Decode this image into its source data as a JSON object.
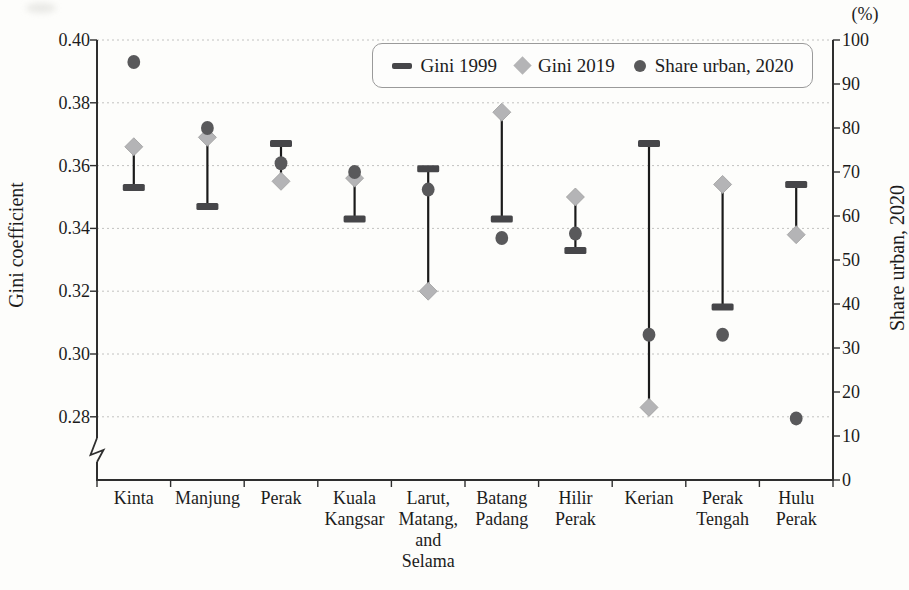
{
  "figure": {
    "unit_label": "(%)",
    "left_axis_title": "Gini coefficient",
    "right_axis_title": "Share urban, 2020",
    "legend_items": [
      {
        "marker": "dash-icon",
        "label": "Gini 1999"
      },
      {
        "marker": "diamond-icon",
        "label": "Gini 2019"
      },
      {
        "marker": "circle-icon",
        "label": "Share urban, 2020"
      }
    ],
    "colors": {
      "gini1999_dash": "#464649",
      "gini2019_diamond": "#b4b4b6",
      "gini2019_diamond_edge": "#9e9e9e",
      "share_urban_circle": "#59595b",
      "connector_line": "#1a1a1a",
      "gridline": "#c2c2c0",
      "axis": "#2e2e2e",
      "text": "#1c1c1c",
      "legend_border": "#9a9a9a"
    }
  },
  "chart_data": {
    "type": "scatter",
    "title": "",
    "categories": [
      "Kinta",
      "Manjung",
      "Perak",
      "Kuala Kangsar",
      "Larut, Matang, and Selama",
      "Batang Padang",
      "Hilir Perak",
      "Kerian",
      "Perak Tengah",
      "Hulu Perak"
    ],
    "category_display": [
      "Kinta",
      "Manjung",
      "Perak",
      "Kuala\nKangsar",
      "Larut,\nMatang,\nand\nSelama",
      "Batang\nPadang",
      "Hilir\nPerak",
      "Kerian",
      "Perak\nTengah",
      "Hulu\nPerak"
    ],
    "series": [
      {
        "name": "Gini 1999",
        "marker": "dash",
        "axis": "left",
        "values": [
          0.353,
          0.347,
          0.367,
          0.343,
          0.359,
          0.343,
          0.333,
          0.367,
          0.315,
          0.354
        ]
      },
      {
        "name": "Gini 2019",
        "marker": "diamond",
        "axis": "left",
        "values": [
          0.366,
          0.369,
          0.355,
          0.356,
          0.32,
          0.377,
          0.35,
          0.283,
          0.354,
          0.338
        ]
      },
      {
        "name": "Share urban, 2020",
        "marker": "circle",
        "axis": "right",
        "values": [
          95,
          80,
          72,
          70,
          66,
          55,
          56,
          33,
          33,
          14
        ]
      }
    ],
    "left_axis": {
      "label": "Gini coefficient",
      "ticks": [
        0.4,
        0.38,
        0.36,
        0.34,
        0.32,
        0.3,
        0.28
      ],
      "range": [
        0.28,
        0.4
      ],
      "broken_below": 0.28
    },
    "right_axis": {
      "label": "Share urban, 2020",
      "unit": "(%)",
      "ticks": [
        100,
        90,
        80,
        70,
        60,
        50,
        40,
        30,
        20,
        10,
        0
      ],
      "range": [
        0,
        100
      ]
    },
    "grid": "horizontal dotted lines at left-axis ticks",
    "legend_position": "top center inside plot",
    "annotation": "Vertical line connects the Gini 1999 and Gini 2019 markers for each district; circles show urban share on the right axis"
  }
}
